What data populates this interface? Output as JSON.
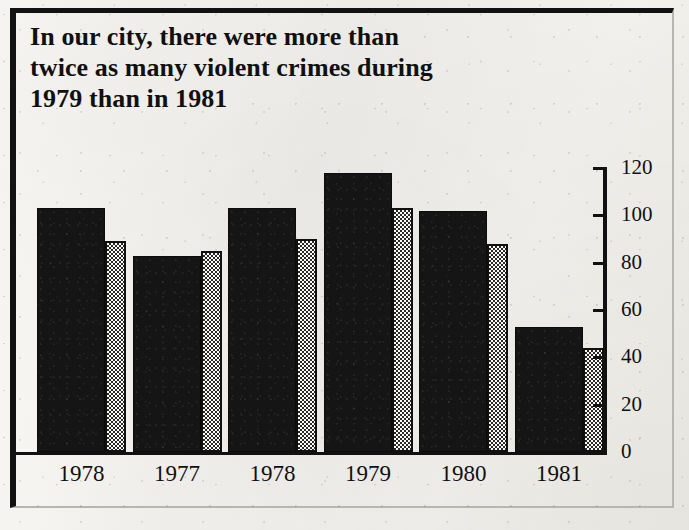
{
  "headline": {
    "line1": "In our city, there were more than",
    "line2": "twice as many violent crimes during",
    "line3": "1979 than in 1981"
  },
  "chart_data": {
    "type": "bar",
    "title": "In our city, there were more than twice as many violent crimes during 1979 than in 1981",
    "xlabel": "",
    "ylabel": "",
    "ylim": [
      0,
      120
    ],
    "yticks": [
      0,
      20,
      40,
      60,
      80,
      100,
      120
    ],
    "grid": false,
    "legend": "none",
    "categories": [
      "1978",
      "1977",
      "1978",
      "1979",
      "1980",
      "1981"
    ],
    "series": [
      {
        "name": "solid",
        "style": "solid-black",
        "values": [
          103,
          83,
          103,
          118,
          102,
          53
        ]
      },
      {
        "name": "stipple",
        "style": "stippled",
        "values": [
          89,
          85,
          90,
          103,
          88,
          44
        ]
      }
    ]
  }
}
